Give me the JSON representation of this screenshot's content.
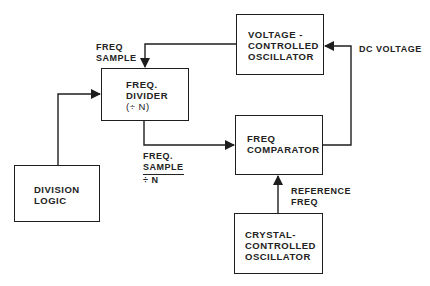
{
  "diagram": {
    "type": "block-diagram",
    "blocks": {
      "vco": {
        "lines": [
          "VOLTAGE -",
          "CONTROLLED",
          "OSCILLATOR"
        ]
      },
      "divider": {
        "lines": [
          "FREQ.",
          "DIVIDER",
          "(÷ N)"
        ]
      },
      "comparator": {
        "lines": [
          "FREQ",
          "COMPARATOR"
        ]
      },
      "division_logic": {
        "lines": [
          "DIVISION",
          "LOGIC"
        ]
      },
      "crystal": {
        "lines": [
          "CRYSTAL-",
          "CONTROLLED",
          "OSCILLATOR"
        ]
      }
    },
    "labels": {
      "freq_sample": [
        "FREQ",
        "SAMPLE"
      ],
      "dc_voltage": "DC VOLTAGE",
      "freq_sample_div_n": {
        "numerator": [
          "FREQ.",
          "SAMPLE"
        ],
        "denominator": "÷  N"
      },
      "reference_freq": [
        "REFERENCE",
        "FREQ"
      ]
    },
    "connections": [
      {
        "from": "vco",
        "to": "divider",
        "label": "FREQ SAMPLE"
      },
      {
        "from": "division_logic",
        "to": "divider"
      },
      {
        "from": "divider",
        "to": "comparator",
        "label": "FREQ. SAMPLE / ÷ N"
      },
      {
        "from": "crystal",
        "to": "comparator",
        "label": "REFERENCE FREQ"
      },
      {
        "from": "comparator",
        "to": "vco",
        "label": "DC VOLTAGE"
      }
    ],
    "colors": {
      "ink": "#1e1e1e",
      "background": "#ffffff"
    }
  }
}
